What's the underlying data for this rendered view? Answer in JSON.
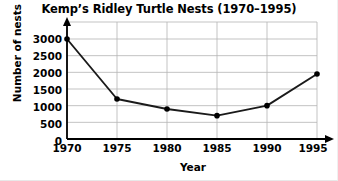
{
  "chart_data": {
    "type": "line",
    "title": "Kemp’s Ridley Turtle Nests (1970–1995)",
    "xlabel": "Year",
    "ylabel": "Number of nests",
    "x": [
      1970,
      1975,
      1980,
      1985,
      1990,
      1995
    ],
    "categories": [
      "1970",
      "1975",
      "1980",
      "1985",
      "1990",
      "1995"
    ],
    "values": [
      3000,
      1200,
      900,
      700,
      1000,
      1950
    ],
    "series": [
      {
        "name": "Number of nests",
        "values": [
          3000,
          1200,
          900,
          700,
          1000,
          1950
        ]
      }
    ],
    "xlim": [
      1970,
      1995
    ],
    "ylim": [
      0,
      3000
    ],
    "ytick_labels": [
      "3000",
      "2500",
      "2000",
      "1500",
      "1000",
      "500",
      "0"
    ],
    "ytick_values": [
      3000,
      2500,
      2000,
      1500,
      1000,
      500,
      0
    ],
    "xtick_labels": [
      "1970",
      "1975",
      "1980",
      "1985",
      "1990",
      "1995"
    ],
    "xtick_values": [
      1970,
      1975,
      1980,
      1985,
      1990,
      1995
    ],
    "grid": true,
    "legend": "none",
    "line_color": "#1a1a1a",
    "marker_color": "#000000",
    "grid_color": "#b4b4b4",
    "axis_color": "#000000",
    "background": "#ffffff"
  }
}
